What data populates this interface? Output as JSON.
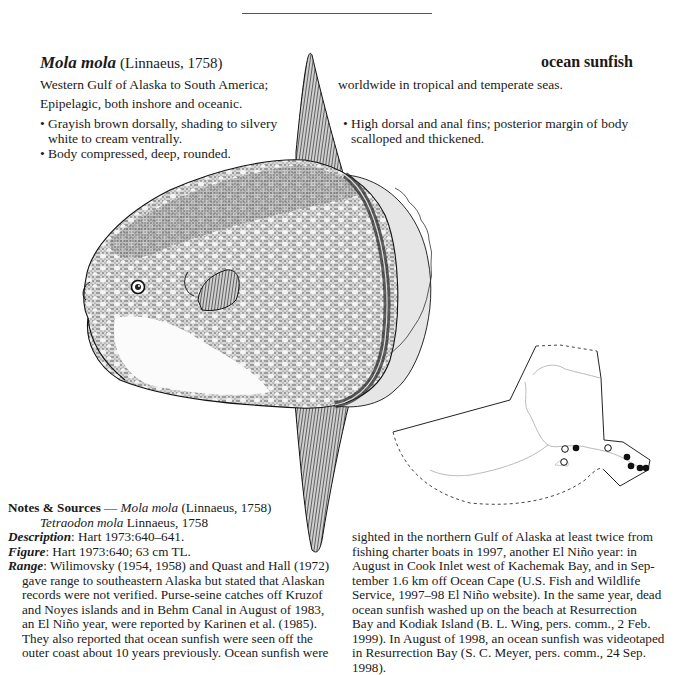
{
  "header": {
    "scientific_name": "Mola mola",
    "authority": "(Linnaeus, 1758)",
    "common_name": "ocean sunfish"
  },
  "range_line": {
    "left": "Western Gulf of Alaska to South America;",
    "right": "worldwide in tropical and temperate seas."
  },
  "habitat": "Epipelagic, both inshore and oceanic.",
  "characters_left": [
    {
      "line1": "Grayish brown dorsally, shading to silvery",
      "line2": "white to cream ventrally."
    },
    {
      "line1": "Body compressed, deep, rounded.",
      "line2": ""
    }
  ],
  "characters_right": [
    {
      "line1": "High dorsal and anal fins; posterior margin of body",
      "line2": "scalloped and thickened."
    }
  ],
  "figure": {
    "map": {
      "region": "Alaska",
      "records_open": [
        [
          565,
          448
        ],
        [
          564,
          462
        ],
        [
          608,
          448
        ]
      ],
      "records_filled": [
        [
          576,
          447
        ],
        [
          626,
          457
        ],
        [
          630,
          466
        ],
        [
          640,
          468
        ],
        [
          646,
          468
        ]
      ]
    }
  },
  "notes": {
    "heading": "Notes & Sources",
    "dash": " — ",
    "heading_sci": "Mola mola",
    "heading_auth": " (Linnaeus, 1758)",
    "synonym_sci": "Tetraodon mola",
    "synonym_auth": " Linnaeus, 1758",
    "description_label": "Description",
    "description_text": ": Hart 1973:640–641.",
    "figure_label": "Figure",
    "figure_text": ": Hart 1973:640; 63 cm TL.",
    "range_label": "Range",
    "range_left_lines": [
      ": Wilimovsky (1954, 1958) and Quast and Hall (1972)",
      "gave range to southeastern Alaska but stated that Alaskan",
      "records were not verified. Purse-seine catches off Kruzof",
      "and Noyes islands and in Behm Canal in August of 1983,",
      "an El Niño year, were reported by Karinen et al. (1985).",
      "They also reported that ocean sunfish were seen off the",
      "outer coast about 10 years previously. Ocean sunfish were"
    ],
    "range_right_lines": [
      "sighted in the northern Gulf of Alaska at least twice from",
      "fishing charter boats in 1997, another El Niño year: in",
      "August in Cook Inlet west of Kachemak Bay, and in Sep-",
      "tember 1.6 km off Ocean Cape (U.S. Fish and Wildlife",
      "Service, 1997–98 El Niño website). In the same year, dead",
      "ocean sunfish washed up on the beach at Resurrection",
      "Bay and Kodiak Island (B. L. Wing, pers. comm., 2 Feb.",
      "1999). In August of 1998, an ocean sunfish was videotaped",
      "in Resurrection Bay (S. C. Meyer, pers. comm., 24 Sep. 1998)."
    ]
  }
}
